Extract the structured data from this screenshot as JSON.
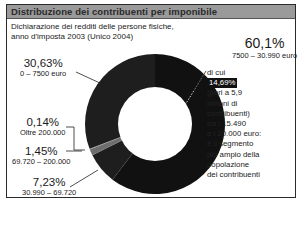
{
  "header": {
    "title": "Distribuzione dei contribuenti per imponibile",
    "subtitle_line1": "Dichiarazione dei redditi delle persone fisiche,",
    "subtitle_line2": "anno d'imposta 2003 (Unico 2004)"
  },
  "labels": {
    "s1_pct": "60,1%",
    "s1_range": "7500 – 30.990 euro",
    "s2_pct": "30,63%",
    "s2_range": "0 – 7500 euro",
    "s3_pct": "0,14%",
    "s3_range": "Oltre 200.000",
    "s4_pct": "1,45%",
    "s4_range": "69.720 – 200.000",
    "s5_pct": "7,23%",
    "s5_range": "30.990 – 69.720"
  },
  "note": {
    "line1": "di cui",
    "highlight": "14,69%",
    "line3": "(pari a 5,9",
    "line4": "milioni di",
    "line5": "contribuenti)",
    "line6": "tra i 15.490",
    "line7": "e i 20.000 euro:",
    "line8": "è il segmento",
    "line9": "più ampio della",
    "line10": "popolazione",
    "line11": "dei contribuenti"
  },
  "colors": {
    "segment_main": "#111111",
    "segment_dark": "#1e1e1e",
    "segment_gray": "#6e6e6e",
    "title_bar": "#9a9a9a"
  },
  "chart_data": {
    "type": "pie",
    "variant": "donut",
    "title": "Distribuzione dei contribuenti per imponibile",
    "subtitle": "Dichiarazione dei redditi delle persone fisiche, anno d'imposta 2003 (Unico 2004)",
    "categories": [
      "7500 – 30.990 euro",
      "30.990 – 69.720",
      "69.720 – 200.000",
      "Oltre 200.000",
      "0 – 7500 euro"
    ],
    "values": [
      60.1,
      7.23,
      1.45,
      0.14,
      30.63
    ],
    "unit": "%",
    "annotation": "di cui 14,69% (pari a 5,9 milioni di contribuenti) tra i 15.490 e i 20.000 euro: è il segmento più ampio della popolazione dei contribuenti",
    "annotation_parent_segment": "7500 – 30.990 euro",
    "start_angle": "12 o'clock, clockwise"
  }
}
